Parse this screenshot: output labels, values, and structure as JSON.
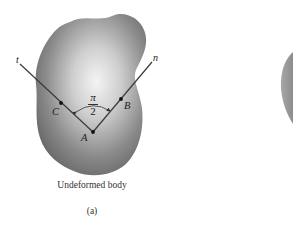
{
  "figure": {
    "caption": "Undeformed body",
    "sublabel": "(a)",
    "axes": {
      "t_label": "t",
      "n_label": "n"
    },
    "points": {
      "A": "A",
      "B": "B",
      "C": "C"
    },
    "angle": {
      "numerator": "π",
      "denominator": "2"
    },
    "colors": {
      "body_light": "#f2f2f2",
      "body_dark": "#6e6e6e",
      "line": "#3a3a3a",
      "second_body": "#9a9a9a"
    }
  }
}
